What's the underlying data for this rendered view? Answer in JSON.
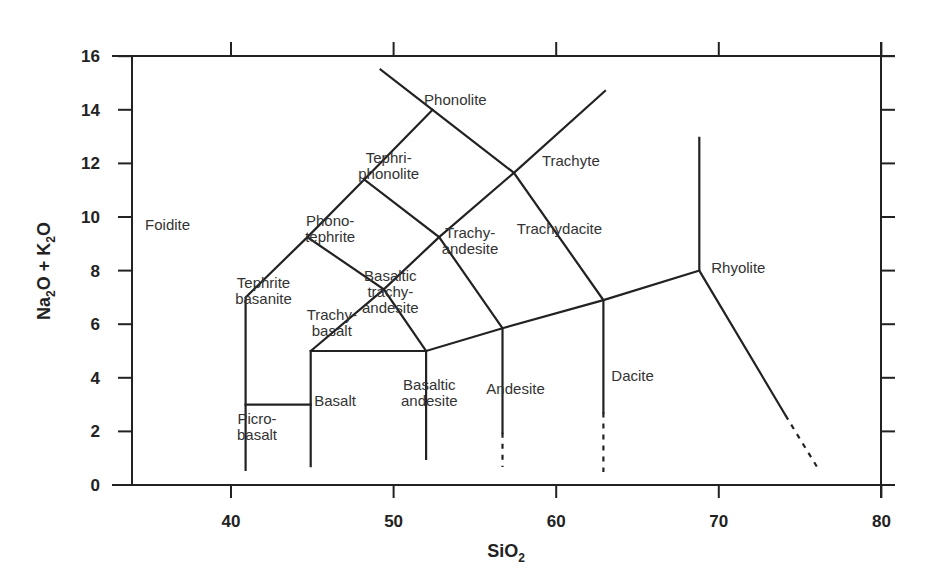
{
  "chart_data": {
    "type": "diagram",
    "title": "",
    "name": "Total Alkali-Silica (TAS) classification",
    "xlabel": "SiO2",
    "xlabel_main": "SiO",
    "xlabel_sub": "2",
    "ylabel": "Na2O + K2O",
    "ylabel_parts": [
      {
        "text": "Na",
        "sub": false
      },
      {
        "text": "2",
        "sub": true
      },
      {
        "text": "O + K",
        "sub": false
      },
      {
        "text": "2",
        "sub": true
      },
      {
        "text": "O",
        "sub": false
      }
    ],
    "xlim": [
      33.8,
      80
    ],
    "ylim": [
      0,
      16
    ],
    "xticks": [
      40,
      50,
      60,
      70,
      80
    ],
    "yticks": [
      0,
      2,
      4,
      6,
      8,
      10,
      12,
      14,
      16
    ],
    "grid": false,
    "fields": [
      {
        "name": "Foidite",
        "lines": [
          "Foidite"
        ],
        "x": 36.1,
        "y": 9.7
      },
      {
        "name": "Picrobasalt",
        "lines": [
          "Picro-",
          "basalt"
        ],
        "x": 41.6,
        "y": 2.15
      },
      {
        "name": "Basalt",
        "lines": [
          "Basalt"
        ],
        "x": 46.4,
        "y": 3.15
      },
      {
        "name": "Basaltic andesite",
        "lines": [
          "Basaltic",
          "andesite"
        ],
        "x": 52.2,
        "y": 3.45
      },
      {
        "name": "Andesite",
        "lines": [
          "Andesite"
        ],
        "x": 57.5,
        "y": 3.6
      },
      {
        "name": "Dacite",
        "lines": [
          "Dacite"
        ],
        "x": 64.7,
        "y": 4.05
      },
      {
        "name": "Rhyolite",
        "lines": [
          "Rhyolite"
        ],
        "x": 71.2,
        "y": 8.1
      },
      {
        "name": "Tephrite basanite",
        "lines": [
          "Tephrite",
          "basanite"
        ],
        "x": 42.0,
        "y": 7.25
      },
      {
        "name": "Trachybasalt",
        "lines": [
          "Trachy-",
          "basalt"
        ],
        "x": 46.2,
        "y": 6.05
      },
      {
        "name": "Basaltic trachyandesite",
        "lines": [
          "Basaltic",
          "trachy-",
          "andesite"
        ],
        "x": 49.8,
        "y": 7.2
      },
      {
        "name": "Trachyandesite",
        "lines": [
          "Trachy-",
          "andesite"
        ],
        "x": 54.7,
        "y": 9.1
      },
      {
        "name": "Trachydacite",
        "lines": [
          "Trachydacite"
        ],
        "x": 60.2,
        "y": 9.55
      },
      {
        "name": "Phonotephrite",
        "lines": [
          "Phono-",
          "tephrite"
        ],
        "x": 46.1,
        "y": 9.55
      },
      {
        "name": "Tephriphonolite",
        "lines": [
          "Tephri-",
          "phonolite"
        ],
        "x": 49.7,
        "y": 11.9
      },
      {
        "name": "Phonolite",
        "lines": [
          "Phonolite"
        ],
        "x": 53.8,
        "y": 14.35
      },
      {
        "name": "Trachyte",
        "lines": [
          "Trachyte"
        ],
        "x": 60.9,
        "y": 12.1
      }
    ],
    "boundaries": [
      {
        "points": [
          [
            40.9,
            0.56
          ],
          [
            40.9,
            7.0
          ],
          [
            44.7,
            9.25
          ],
          [
            48.2,
            11.4
          ],
          [
            52.4,
            14.0
          ]
        ],
        "style": "solid"
      },
      {
        "points": [
          [
            49.2,
            15.5
          ],
          [
            52.4,
            14.0
          ],
          [
            57.4,
            11.65
          ],
          [
            62.9,
            6.9
          ]
        ],
        "style": "solid"
      },
      {
        "points": [
          [
            40.9,
            3.0
          ],
          [
            44.9,
            3.0
          ]
        ],
        "style": "solid"
      },
      {
        "points": [
          [
            44.9,
            0.7
          ],
          [
            44.9,
            5.0
          ],
          [
            52.0,
            5.0
          ],
          [
            52.0,
            0.97
          ]
        ],
        "style": "solid"
      },
      {
        "points": [
          [
            44.9,
            5.0
          ],
          [
            49.4,
            7.3
          ],
          [
            52.8,
            9.25
          ],
          [
            57.4,
            11.65
          ],
          [
            63.0,
            14.7
          ]
        ],
        "style": "solid"
      },
      {
        "points": [
          [
            44.7,
            9.25
          ],
          [
            49.4,
            7.3
          ],
          [
            52.0,
            5.0
          ]
        ],
        "style": "solid"
      },
      {
        "points": [
          [
            48.2,
            11.4
          ],
          [
            52.8,
            9.25
          ],
          [
            56.7,
            5.85
          ]
        ],
        "style": "solid"
      },
      {
        "points": [
          [
            52.0,
            5.0
          ],
          [
            56.7,
            5.85
          ],
          [
            62.9,
            6.9
          ],
          [
            68.8,
            8.0
          ]
        ],
        "style": "solid"
      },
      {
        "points": [
          [
            56.7,
            5.85
          ],
          [
            56.7,
            1.95
          ]
        ],
        "style": "solid"
      },
      {
        "points": [
          [
            56.7,
            1.95
          ],
          [
            56.7,
            0.67
          ]
        ],
        "style": "dashed"
      },
      {
        "points": [
          [
            62.9,
            6.9
          ],
          [
            62.9,
            2.7
          ]
        ],
        "style": "solid"
      },
      {
        "points": [
          [
            62.9,
            2.7
          ],
          [
            62.9,
            0.49
          ]
        ],
        "style": "dashed"
      },
      {
        "points": [
          [
            68.8,
            12.95
          ],
          [
            68.8,
            8.0
          ],
          [
            74.1,
            2.6
          ]
        ],
        "style": "solid"
      },
      {
        "points": [
          [
            74.1,
            2.6
          ],
          [
            76.2,
            0.52
          ]
        ],
        "style": "dashed"
      }
    ]
  }
}
